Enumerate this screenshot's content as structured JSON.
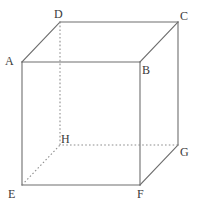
{
  "figure": {
    "type": "geometry-diagram",
    "width": 201,
    "height": 205,
    "background_color": "#ffffff",
    "solid_edge_color": "#6e6e6e",
    "hidden_edge_color": "#8d8d8d",
    "label_color": "#3a3a3a"
  },
  "vertices": [
    {
      "id": "A",
      "label": "A",
      "x": 22,
      "y": 62,
      "label_x": 5,
      "label_y": 55,
      "face": "front",
      "hidden": false
    },
    {
      "id": "B",
      "label": "B",
      "x": 140,
      "y": 62,
      "label_x": 142,
      "label_y": 64,
      "face": "front",
      "hidden": false
    },
    {
      "id": "C",
      "label": "C",
      "x": 178,
      "y": 22,
      "label_x": 180,
      "label_y": 10,
      "face": "back",
      "hidden": false
    },
    {
      "id": "D",
      "label": "D",
      "x": 60,
      "y": 22,
      "label_x": 54,
      "label_y": 8,
      "face": "back",
      "hidden": false
    },
    {
      "id": "E",
      "label": "E",
      "x": 22,
      "y": 185,
      "label_x": 8,
      "label_y": 188,
      "face": "front",
      "hidden": false
    },
    {
      "id": "F",
      "label": "F",
      "x": 140,
      "y": 185,
      "label_x": 137,
      "label_y": 188,
      "face": "front",
      "hidden": false
    },
    {
      "id": "G",
      "label": "G",
      "x": 178,
      "y": 145,
      "label_x": 180,
      "label_y": 146,
      "face": "back",
      "hidden": false
    },
    {
      "id": "H",
      "label": "H",
      "x": 60,
      "y": 145,
      "label_x": 61,
      "label_y": 133,
      "face": "back",
      "hidden": true
    }
  ],
  "edges": [
    {
      "id": "AB",
      "from": "A",
      "to": "B",
      "style": "solid",
      "group": "front-face-top"
    },
    {
      "id": "BF",
      "from": "B",
      "to": "F",
      "style": "solid",
      "group": "front-face-right"
    },
    {
      "id": "FE",
      "from": "F",
      "to": "E",
      "style": "solid",
      "group": "front-face-bottom"
    },
    {
      "id": "EA",
      "from": "E",
      "to": "A",
      "style": "solid",
      "group": "front-face-left"
    },
    {
      "id": "DC",
      "from": "D",
      "to": "C",
      "style": "solid",
      "group": "back-face-top"
    },
    {
      "id": "CG",
      "from": "C",
      "to": "G",
      "style": "solid",
      "group": "back-face-right"
    },
    {
      "id": "GH",
      "from": "G",
      "to": "H",
      "style": "hidden",
      "group": "back-face-bottom"
    },
    {
      "id": "HD",
      "from": "H",
      "to": "D",
      "style": "hidden",
      "group": "back-face-left"
    },
    {
      "id": "AD",
      "from": "A",
      "to": "D",
      "style": "solid",
      "group": "connector-top-left"
    },
    {
      "id": "BC",
      "from": "B",
      "to": "C",
      "style": "solid",
      "group": "connector-top-right"
    },
    {
      "id": "FG",
      "from": "F",
      "to": "G",
      "style": "solid",
      "group": "connector-bottom-right"
    },
    {
      "id": "EH",
      "from": "E",
      "to": "H",
      "style": "hidden",
      "group": "connector-bottom-left"
    }
  ]
}
